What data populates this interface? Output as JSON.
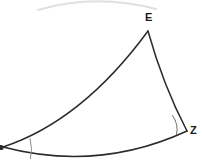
{
  "figure": {
    "type": "geometry-diagram",
    "background_color": "#ffffff",
    "stroke_color": "#2b2b2b",
    "label_color": "#1a1a1a",
    "faint_stroke_color": "#b8b8b8",
    "canvas": {
      "width": 202,
      "height": 162
    }
  },
  "labels": {
    "apex": "E",
    "right_vertex": "Z",
    "left_vertex": "D"
  },
  "vertices": {
    "E": {
      "x": 148,
      "y": 31
    },
    "Z": {
      "x": 187,
      "y": 131
    },
    "D": {
      "x": 3,
      "y": 147
    }
  },
  "edges": [
    {
      "name": "edge-D-E",
      "from": "D",
      "to": "E",
      "curvature": "concave-up",
      "control": {
        "x": 80,
        "y": 118
      }
    },
    {
      "name": "edge-E-Z",
      "from": "E",
      "to": "Z",
      "curvature": "slight-bulge-left",
      "control": {
        "x": 162,
        "y": 84
      }
    },
    {
      "name": "edge-D-Z",
      "from": "D",
      "to": "Z",
      "curvature": "convex-down",
      "control": {
        "x": 98,
        "y": 170
      }
    }
  ],
  "angle_marks": [
    {
      "name": "angle-mark-D",
      "at_vertex": "D",
      "radius": 28,
      "style": "thin-arc"
    },
    {
      "name": "angle-mark-Z",
      "at_vertex": "Z",
      "radius": 17,
      "style": "thin-arc"
    }
  ],
  "decorations": [
    {
      "name": "faint-top-arc",
      "description": "faint grey arc clipped at top edge of the image",
      "color": "#c9c9c9"
    }
  ]
}
